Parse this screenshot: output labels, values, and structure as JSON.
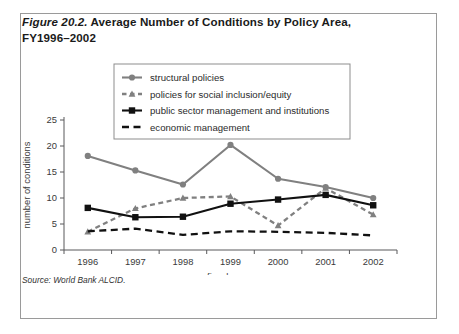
{
  "figure": {
    "number_label": "Figure 20.2.",
    "title_rest": " Average Number of Conditions by Policy Area, FY1996–2002",
    "source": "Source: World Bank ALCID."
  },
  "chart_data": {
    "type": "line",
    "title": "Average Number of Conditions by Policy Area, FY1996–2002",
    "xlabel": "fiscal years",
    "ylabel": "number of conditions",
    "categories": [
      "1996",
      "1997",
      "1998",
      "1999",
      "2000",
      "2001",
      "2002"
    ],
    "ylim": [
      0,
      25
    ],
    "yticks": [
      "0",
      "5",
      "10",
      "15",
      "20",
      "25"
    ],
    "grid": false,
    "legend_position": "top-center",
    "series": [
      {
        "name": "structural policies",
        "values": [
          18.1,
          15.3,
          12.6,
          20.2,
          13.7,
          12.1,
          10.0
        ],
        "color": "#808080",
        "dash": "none",
        "marker": "circle"
      },
      {
        "name": "policies for social inclusion/equity",
        "values": [
          3.5,
          8.0,
          10.0,
          10.3,
          4.7,
          11.9,
          6.8
        ],
        "color": "#808080",
        "dash": "dashed",
        "marker": "triangle"
      },
      {
        "name": "public sector management and institutions",
        "values": [
          8.1,
          6.3,
          6.4,
          8.9,
          9.7,
          10.6,
          8.6
        ],
        "color": "#111111",
        "dash": "none",
        "marker": "square"
      },
      {
        "name": "economic management",
        "values": [
          3.6,
          4.1,
          2.9,
          3.6,
          3.5,
          3.3,
          2.8
        ],
        "color": "#111111",
        "dash": "dashed",
        "marker": "none"
      }
    ]
  }
}
